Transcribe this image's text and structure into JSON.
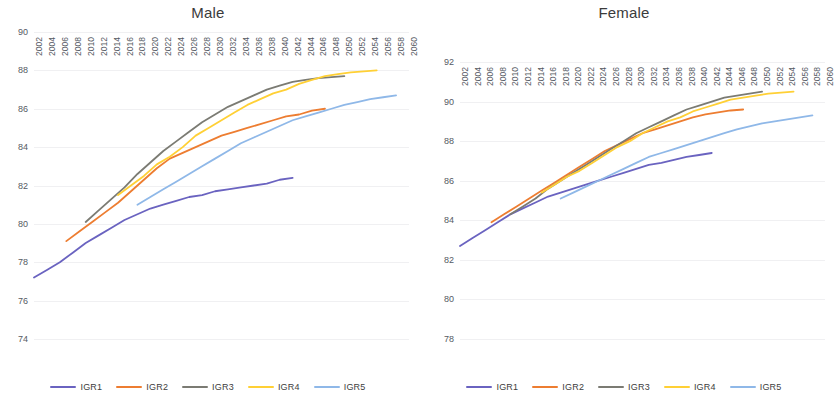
{
  "figure": {
    "width": 832,
    "height": 394,
    "background": "#ffffff"
  },
  "series_colors": {
    "IGR1": "#6a63c0",
    "IGR2": "#ed7d31",
    "IGR3": "#7b7b73",
    "IGR4": "#ffd035",
    "IGR5": "#8fb8e8"
  },
  "legend": {
    "position": "bottom-center",
    "items": [
      {
        "label": "IGR1",
        "color": "#6a63c0"
      },
      {
        "label": "IGR2",
        "color": "#ed7d31"
      },
      {
        "label": "IGR3",
        "color": "#7b7b73"
      },
      {
        "label": "IGR4",
        "color": "#ffd035"
      },
      {
        "label": "IGR5",
        "color": "#8fb8e8"
      }
    ]
  },
  "x_tick_labels": [
    "2002",
    "2004",
    "2006",
    "2008",
    "2010",
    "2012",
    "2014",
    "2016",
    "2018",
    "2020",
    "2022",
    "2024",
    "2026",
    "2028",
    "2030",
    "2032",
    "2034",
    "2036",
    "2038",
    "2040",
    "2042",
    "2044",
    "2046",
    "2048",
    "2050",
    "2052",
    "2054",
    "2056",
    "2058",
    "2060"
  ],
  "chart_data": [
    {
      "type": "line",
      "title": "Male",
      "xlabel": "",
      "ylabel": "",
      "xlim": [
        2002,
        2060
      ],
      "ylim": [
        74,
        90
      ],
      "ytick_labels": [
        "74",
        "76",
        "78",
        "80",
        "82",
        "84",
        "86",
        "88",
        "90"
      ],
      "yticks": [
        74,
        76,
        78,
        80,
        82,
        84,
        86,
        88,
        90
      ],
      "grid": true,
      "legend": [
        "IGR1",
        "IGR2",
        "IGR3",
        "IGR4",
        "IGR5"
      ],
      "series": [
        {
          "name": "IGR1",
          "color": "#6a63c0",
          "x": [
            2002,
            2004,
            2006,
            2008,
            2010,
            2012,
            2014,
            2016,
            2018,
            2020,
            2022,
            2024,
            2026,
            2028,
            2030,
            2032,
            2034,
            2036,
            2038,
            2040,
            2042
          ],
          "values": [
            77.2,
            77.6,
            78.0,
            78.5,
            79.0,
            79.4,
            79.8,
            80.2,
            80.5,
            80.8,
            81.0,
            81.2,
            81.4,
            81.5,
            81.7,
            81.8,
            81.9,
            82.0,
            82.1,
            82.3,
            82.4
          ]
        },
        {
          "name": "IGR2",
          "color": "#ed7d31",
          "x": [
            2007,
            2009,
            2011,
            2013,
            2015,
            2017,
            2019,
            2021,
            2023,
            2025,
            2027,
            2029,
            2031,
            2033,
            2035,
            2037,
            2039,
            2041,
            2043,
            2045,
            2047
          ],
          "values": [
            79.1,
            79.6,
            80.1,
            80.6,
            81.1,
            81.7,
            82.3,
            82.9,
            83.4,
            83.7,
            84.0,
            84.3,
            84.6,
            84.8,
            85.0,
            85.2,
            85.4,
            85.6,
            85.7,
            85.9,
            86.0
          ]
        },
        {
          "name": "IGR3",
          "color": "#7b7b73",
          "x": [
            2010,
            2012,
            2014,
            2016,
            2018,
            2020,
            2022,
            2024,
            2026,
            2028,
            2030,
            2032,
            2034,
            2036,
            2038,
            2040,
            2042,
            2044,
            2046,
            2048,
            2050
          ],
          "values": [
            80.1,
            80.7,
            81.3,
            81.9,
            82.6,
            83.2,
            83.8,
            84.3,
            84.8,
            85.3,
            85.7,
            86.1,
            86.4,
            86.7,
            87.0,
            87.2,
            87.4,
            87.5,
            87.6,
            87.65,
            87.7
          ]
        },
        {
          "name": "IGR4",
          "color": "#ffd035",
          "x": [
            2015,
            2017,
            2019,
            2021,
            2023,
            2025,
            2027,
            2029,
            2031,
            2033,
            2035,
            2037,
            2039,
            2041,
            2043,
            2045,
            2047,
            2049,
            2051,
            2053,
            2055
          ],
          "values": [
            81.5,
            82.0,
            82.5,
            83.1,
            83.5,
            84.0,
            84.6,
            85.0,
            85.4,
            85.8,
            86.2,
            86.5,
            86.8,
            87.0,
            87.3,
            87.5,
            87.7,
            87.8,
            87.9,
            87.95,
            88.0
          ]
        },
        {
          "name": "IGR5",
          "color": "#8fb8e8",
          "x": [
            2018,
            2020,
            2022,
            2024,
            2026,
            2028,
            2030,
            2032,
            2034,
            2036,
            2038,
            2040,
            2042,
            2044,
            2046,
            2048,
            2050,
            2052,
            2054,
            2056,
            2058
          ],
          "values": [
            81.0,
            81.4,
            81.8,
            82.2,
            82.6,
            83.0,
            83.4,
            83.8,
            84.2,
            84.5,
            84.8,
            85.1,
            85.4,
            85.6,
            85.8,
            86.0,
            86.2,
            86.35,
            86.5,
            86.6,
            86.7
          ]
        }
      ]
    },
    {
      "type": "line",
      "title": "Female",
      "xlabel": "",
      "ylabel": "",
      "xlim": [
        2002,
        2060
      ],
      "ylim": [
        78,
        92
      ],
      "ytick_labels": [
        "78",
        "80",
        "82",
        "84",
        "86",
        "88",
        "90",
        "92"
      ],
      "yticks": [
        78,
        80,
        82,
        84,
        86,
        88,
        90,
        92
      ],
      "grid": true,
      "legend": [
        "IGR1",
        "IGR2",
        "IGR3",
        "IGR4",
        "IGR5"
      ],
      "series": [
        {
          "name": "IGR1",
          "color": "#6a63c0",
          "x": [
            2002,
            2004,
            2006,
            2008,
            2010,
            2012,
            2014,
            2016,
            2018,
            2020,
            2022,
            2024,
            2026,
            2028,
            2030,
            2032,
            2034,
            2036,
            2038,
            2040,
            2042
          ],
          "values": [
            82.7,
            83.1,
            83.5,
            83.9,
            84.3,
            84.6,
            84.9,
            85.2,
            85.4,
            85.6,
            85.8,
            86.0,
            86.2,
            86.4,
            86.6,
            86.8,
            86.9,
            87.05,
            87.2,
            87.3,
            87.4
          ]
        },
        {
          "name": "IGR2",
          "color": "#ed7d31",
          "x": [
            2007,
            2009,
            2011,
            2013,
            2015,
            2017,
            2019,
            2021,
            2023,
            2025,
            2027,
            2029,
            2031,
            2033,
            2035,
            2037,
            2039,
            2041,
            2043,
            2045,
            2047
          ],
          "values": [
            83.9,
            84.3,
            84.7,
            85.1,
            85.5,
            85.9,
            86.3,
            86.7,
            87.1,
            87.5,
            87.8,
            88.1,
            88.4,
            88.6,
            88.8,
            89.0,
            89.2,
            89.35,
            89.45,
            89.55,
            89.6
          ]
        },
        {
          "name": "IGR3",
          "color": "#7b7b73",
          "x": [
            2010,
            2012,
            2014,
            2016,
            2018,
            2020,
            2022,
            2024,
            2026,
            2028,
            2030,
            2032,
            2034,
            2036,
            2038,
            2040,
            2042,
            2044,
            2046,
            2048,
            2050
          ],
          "values": [
            84.3,
            84.7,
            85.1,
            85.6,
            86.0,
            86.4,
            86.8,
            87.2,
            87.6,
            88.0,
            88.4,
            88.7,
            89.0,
            89.3,
            89.6,
            89.8,
            90.0,
            90.2,
            90.3,
            90.4,
            90.5
          ]
        },
        {
          "name": "IGR4",
          "color": "#ffd035",
          "x": [
            2015,
            2017,
            2019,
            2021,
            2023,
            2025,
            2027,
            2029,
            2031,
            2033,
            2035,
            2037,
            2039,
            2041,
            2043,
            2045,
            2047,
            2049,
            2051,
            2053,
            2055
          ],
          "values": [
            85.4,
            85.8,
            86.2,
            86.5,
            86.9,
            87.3,
            87.7,
            88.0,
            88.4,
            88.7,
            89.0,
            89.2,
            89.5,
            89.7,
            89.9,
            90.1,
            90.2,
            90.3,
            90.4,
            90.45,
            90.5
          ]
        },
        {
          "name": "IGR5",
          "color": "#8fb8e8",
          "x": [
            2018,
            2020,
            2022,
            2024,
            2026,
            2028,
            2030,
            2032,
            2034,
            2036,
            2038,
            2040,
            2042,
            2044,
            2046,
            2048,
            2050,
            2052,
            2054,
            2056,
            2058
          ],
          "values": [
            85.1,
            85.4,
            85.7,
            86.0,
            86.3,
            86.6,
            86.9,
            87.2,
            87.4,
            87.6,
            87.8,
            88.0,
            88.2,
            88.4,
            88.6,
            88.75,
            88.9,
            89.0,
            89.1,
            89.2,
            89.3
          ]
        }
      ]
    }
  ]
}
